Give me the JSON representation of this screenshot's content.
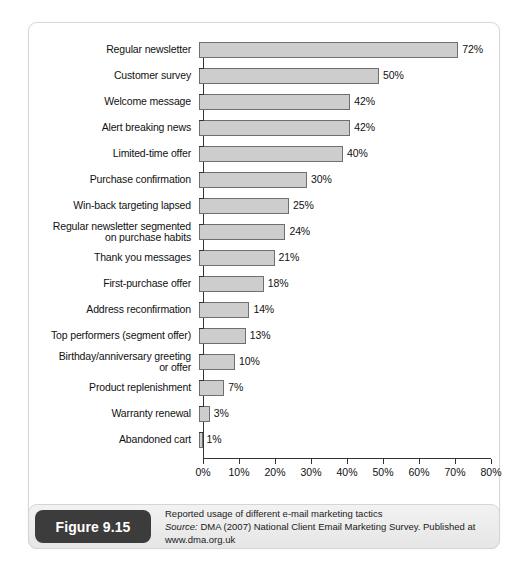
{
  "figure": {
    "badge_label": "Figure 9.15",
    "caption_title": "Reported usage of different e-mail marketing tactics",
    "caption_source_prefix": "Source:",
    "caption_source_rest": " DMA (2007) National Client Email Marketing Survey. Published at www.dma.org.uk"
  },
  "colors": {
    "bar_fill": "#cdcdcd",
    "bar_border": "#6f6f6f",
    "axis": "#333333",
    "badge_bg": "#3c3c3c",
    "caption_bg": "#ebebeb"
  },
  "chart_data": {
    "type": "bar",
    "orientation": "horizontal",
    "title": "Reported usage of different e-mail marketing tactics",
    "xlabel": "",
    "ylabel": "",
    "xlim": [
      0,
      80
    ],
    "xtick_labels": [
      "0%",
      "10%",
      "20%",
      "30%",
      "40%",
      "50%",
      "60%",
      "70%",
      "80%"
    ],
    "xticks": [
      0,
      10,
      20,
      30,
      40,
      50,
      60,
      70,
      80
    ],
    "grid": false,
    "legend": "none",
    "value_suffix": "%",
    "categories": [
      "Regular newsletter",
      "Customer survey",
      "Welcome message",
      "Alert breaking news",
      "Limited-time offer",
      "Purchase confirmation",
      "Win-back targeting lapsed",
      "Regular newsletter segmented\non purchase habits",
      "Thank you messages",
      "First-purchase offer",
      "Address reconfirmation",
      "Top performers (segment offer)",
      "Birthday/anniversary greeting\nor offer",
      "Product replenishment",
      "Warranty renewal",
      "Abandoned cart"
    ],
    "values": [
      72,
      50,
      42,
      42,
      40,
      30,
      25,
      24,
      21,
      18,
      14,
      13,
      10,
      7,
      3,
      1
    ],
    "value_labels": [
      "72%",
      "50%",
      "42%",
      "42%",
      "40%",
      "30%",
      "25%",
      "24%",
      "21%",
      "18%",
      "14%",
      "13%",
      "10%",
      "7%",
      "3%",
      "1%"
    ]
  }
}
